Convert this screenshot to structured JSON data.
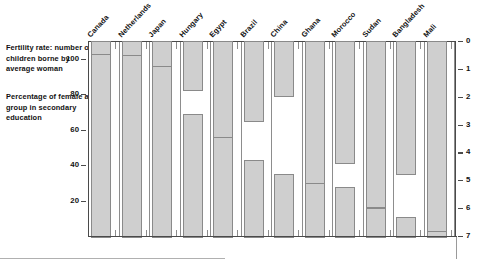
{
  "legend": {
    "fertility": "Fertility rate: number of children borne by average woman",
    "education": "Percentage of female age group in secondary education"
  },
  "axes": {
    "left_ticks": [
      "100",
      "80",
      "60",
      "40",
      "20"
    ],
    "right_ticks": [
      "0",
      "1",
      "2",
      "3",
      "4",
      "5",
      "6",
      "7"
    ]
  },
  "colors": {
    "bar_fill": "#cfcfcf",
    "bar_stroke": "#8a8a8a",
    "axis": "#4a4a4a",
    "grid": "#8d8d8d"
  },
  "chart_data": {
    "type": "bar",
    "title": "",
    "orientation": "back-to-back paired vertical bars",
    "categories": [
      "Canada",
      "Netherlands",
      "Japan",
      "Hungary",
      "Egypt",
      "Brazil",
      "China",
      "Ghana",
      "Morocco",
      "Sudan",
      "Bangladesh",
      "Mali"
    ],
    "series": [
      {
        "name": "Fertility rate: number of children borne by average woman",
        "axis": "right",
        "direction": "downward-from-top",
        "units": "children per woman",
        "values": [
          1.7,
          1.6,
          1.5,
          1.8,
          3.9,
          2.9,
          2.0,
          6.0,
          4.4,
          6.0,
          4.8,
          7.0
        ]
      },
      {
        "name": "Percentage of female age group in secondary education",
        "axis": "left",
        "direction": "upward-from-baseline",
        "units": "%",
        "values": [
          104,
          103,
          97,
          70,
          57,
          44,
          36,
          31,
          29,
          17,
          12,
          4
        ]
      }
    ],
    "xlabel": "",
    "ylabel_left": "Percentage of female age group in secondary education",
    "ylabel_right": "Fertility rate: number of children borne by average woman",
    "ylim_left": [
      0,
      110
    ],
    "ylim_right": [
      0,
      7
    ],
    "left_ticks": [
      100,
      80,
      60,
      40,
      20
    ],
    "right_ticks": [
      0,
      1,
      2,
      3,
      4,
      5,
      6,
      7
    ],
    "grid": "vertical category separators only",
    "legend_position": "left-outside"
  }
}
